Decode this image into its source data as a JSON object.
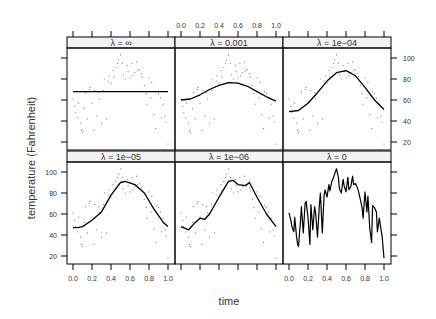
{
  "chart_data": {
    "type": "scatter",
    "title": "",
    "xlabel": "time",
    "ylabel": "temperature (Fahrenheit)",
    "xlim": [
      0.0,
      1.0
    ],
    "ylim": [
      15,
      105
    ],
    "x_ticks": [
      "0.0",
      "0.2",
      "0.4",
      "0.6",
      "0.8",
      "1.0"
    ],
    "y_ticks": [
      "20",
      "40",
      "60",
      "80",
      "100"
    ],
    "grid": false,
    "legend": null,
    "layout": "2 rows x 3 columns trellis panels",
    "panels": [
      {
        "label": "λ = ∞",
        "fit": [
          [
            0.0,
            68
          ],
          [
            1.0,
            68
          ]
        ]
      },
      {
        "label": "λ = 0.001",
        "fit": [
          [
            0.0,
            60
          ],
          [
            0.1,
            61
          ],
          [
            0.2,
            65
          ],
          [
            0.3,
            70
          ],
          [
            0.4,
            74
          ],
          [
            0.5,
            76.5
          ],
          [
            0.6,
            76
          ],
          [
            0.7,
            73
          ],
          [
            0.8,
            68
          ],
          [
            0.9,
            63
          ],
          [
            1.0,
            59
          ]
        ]
      },
      {
        "label": "λ = 1e−04",
        "fit": [
          [
            0.0,
            49
          ],
          [
            0.1,
            50
          ],
          [
            0.2,
            57
          ],
          [
            0.3,
            67
          ],
          [
            0.4,
            78
          ],
          [
            0.5,
            86
          ],
          [
            0.6,
            88
          ],
          [
            0.7,
            83
          ],
          [
            0.8,
            72
          ],
          [
            0.9,
            60
          ],
          [
            1.0,
            51
          ]
        ]
      },
      {
        "label": "λ = 1e−05",
        "fit": [
          [
            0.0,
            47
          ],
          [
            0.05,
            47
          ],
          [
            0.1,
            48
          ],
          [
            0.2,
            54
          ],
          [
            0.3,
            62
          ],
          [
            0.4,
            78
          ],
          [
            0.5,
            90
          ],
          [
            0.55,
            91
          ],
          [
            0.65,
            88
          ],
          [
            0.75,
            80
          ],
          [
            0.85,
            65
          ],
          [
            0.95,
            52
          ],
          [
            1.0,
            48
          ]
        ]
      },
      {
        "label": "λ = 1e−06",
        "fit": [
          [
            0.0,
            48
          ],
          [
            0.08,
            45
          ],
          [
            0.15,
            52
          ],
          [
            0.2,
            56
          ],
          [
            0.25,
            55
          ],
          [
            0.3,
            60
          ],
          [
            0.4,
            76
          ],
          [
            0.5,
            91
          ],
          [
            0.55,
            92
          ],
          [
            0.6,
            88
          ],
          [
            0.68,
            87
          ],
          [
            0.72,
            90
          ],
          [
            0.8,
            76
          ],
          [
            0.9,
            60
          ],
          [
            1.0,
            48
          ]
        ]
      },
      {
        "label": "λ = 0",
        "fit": "interpolates every observation"
      }
    ],
    "observations": [
      [
        0.0,
        61
      ],
      [
        0.02,
        54
      ],
      [
        0.03,
        48
      ],
      [
        0.05,
        43
      ],
      [
        0.06,
        57
      ],
      [
        0.08,
        38
      ],
      [
        0.09,
        31
      ],
      [
        0.1,
        29
      ],
      [
        0.12,
        52
      ],
      [
        0.13,
        67
      ],
      [
        0.15,
        42
      ],
      [
        0.17,
        70
      ],
      [
        0.18,
        72
      ],
      [
        0.2,
        57
      ],
      [
        0.22,
        31
      ],
      [
        0.23,
        69
      ],
      [
        0.25,
        45
      ],
      [
        0.27,
        67
      ],
      [
        0.28,
        61
      ],
      [
        0.3,
        38
      ],
      [
        0.32,
        69
      ],
      [
        0.33,
        80
      ],
      [
        0.35,
        42
      ],
      [
        0.37,
        78
      ],
      [
        0.38,
        83
      ],
      [
        0.4,
        76
      ],
      [
        0.42,
        88
      ],
      [
        0.43,
        82
      ],
      [
        0.45,
        91
      ],
      [
        0.47,
        95
      ],
      [
        0.48,
        98
      ],
      [
        0.5,
        103
      ],
      [
        0.52,
        95
      ],
      [
        0.53,
        84
      ],
      [
        0.55,
        80
      ],
      [
        0.57,
        93
      ],
      [
        0.58,
        87
      ],
      [
        0.6,
        81
      ],
      [
        0.62,
        95
      ],
      [
        0.63,
        83
      ],
      [
        0.65,
        86
      ],
      [
        0.67,
        96
      ],
      [
        0.68,
        88
      ],
      [
        0.7,
        89
      ],
      [
        0.72,
        85
      ],
      [
        0.73,
        82
      ],
      [
        0.75,
        74
      ],
      [
        0.77,
        66
      ],
      [
        0.78,
        56
      ],
      [
        0.8,
        81
      ],
      [
        0.82,
        62
      ],
      [
        0.83,
        77
      ],
      [
        0.85,
        46
      ],
      [
        0.87,
        33
      ],
      [
        0.88,
        68
      ],
      [
        0.9,
        66
      ],
      [
        0.92,
        62
      ],
      [
        0.93,
        43
      ],
      [
        0.95,
        56
      ],
      [
        0.97,
        45
      ],
      [
        0.98,
        39
      ],
      [
        1.0,
        18
      ]
    ]
  },
  "labels": {
    "xlabel": "time",
    "ylabel": "temperature (Fahrenheit)"
  }
}
